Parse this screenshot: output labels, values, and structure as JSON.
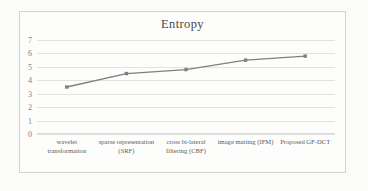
{
  "chart_data": {
    "type": "line",
    "title": "Entropy",
    "xlabel": "",
    "ylabel": "",
    "ylim": [
      0,
      7
    ],
    "yticks": [
      "0",
      "1",
      "2",
      "3",
      "4",
      "5",
      "6",
      "7"
    ],
    "grid": true,
    "legend": "none",
    "series_color": "#7f7f7f",
    "marker": "square",
    "categories": [
      "wavelet transformation",
      "sparse representation (SRF)",
      "cross bi-lateral filtering (CBF)",
      "image matting (IFM)",
      "Proposed GF-DCT"
    ],
    "values": [
      3.5,
      4.5,
      4.8,
      5.5,
      5.8
    ],
    "series": [
      {
        "name": "Entropy",
        "values": [
          3.5,
          4.5,
          4.8,
          5.5,
          5.8
        ]
      }
    ]
  },
  "chart": {
    "title": "Entropy",
    "ytick_labels": [
      "7",
      "6",
      "5",
      "4",
      "3",
      "2",
      "1",
      "0"
    ],
    "x_categories": [
      "wavelet transformation",
      "sparse representation (SRF)",
      "cross bi-lateral filtering (CBF)",
      "image matting (IFM)",
      "Proposed GF-DCT"
    ]
  }
}
